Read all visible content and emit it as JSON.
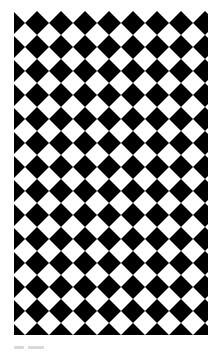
{
  "image": {
    "description": "diagonal black and white checkerboard (diamond) pattern",
    "icon": "checkerboard-pattern",
    "colors": {
      "dark": "#000000",
      "light": "#ffffff",
      "background": "#ffffff",
      "caption": "#d9d9d9"
    },
    "pattern": {
      "pitch_px": 24,
      "rotation_deg": 45
    }
  },
  "caption": {
    "text": ""
  }
}
